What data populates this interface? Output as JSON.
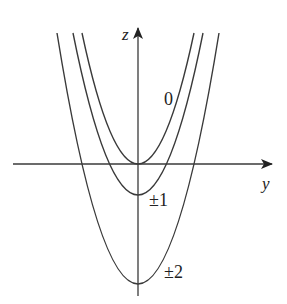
{
  "axes": {
    "vertical_label": "z",
    "horizontal_label": "y"
  },
  "curves": [
    {
      "label": "0",
      "vertex_z": 0
    },
    {
      "label": "±1",
      "vertex_z": -1
    },
    {
      "label": "±2",
      "vertex_z": -2
    }
  ],
  "colors": {
    "stroke": "#3a3a3a",
    "background": "#ffffff"
  }
}
